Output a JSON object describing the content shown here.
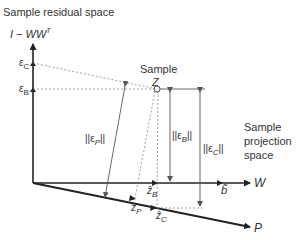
{
  "title": "Sample residual space",
  "axes": {
    "residual": "I − WW",
    "residual_sup": "T",
    "w_axis": "W",
    "p_axis": "P"
  },
  "point": {
    "label_top": "Sample",
    "label_symbol": "Z"
  },
  "side_label": {
    "line1": "Sample",
    "line2": "projection",
    "line3": "space"
  },
  "labels": {
    "eps_c": "ε",
    "eps_c_sub": "C",
    "eps_b": "ε",
    "eps_b_sub": "B",
    "norm_eps_p": "||ε",
    "norm_eps_p_sub": "P",
    "norm_eps_p_end": "||",
    "norm_eps_b": "||ε",
    "norm_eps_b_sub": "B",
    "norm_eps_b_end": "||",
    "norm_eps_c": "||ε",
    "norm_eps_c_sub": "C",
    "norm_eps_c_end": "||",
    "z_b": "ẑ",
    "z_b_sub": "B",
    "z_p": "ẑ",
    "z_p_sub": "P",
    "z_c": "ẑ",
    "z_c_sub": "C",
    "b": "b̃"
  },
  "colors": {
    "axis": "#222222",
    "thin": "#555555",
    "dashed": "#888888"
  }
}
